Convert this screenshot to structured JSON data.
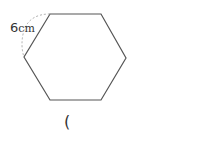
{
  "figure": {
    "shape": "regular-hexagon",
    "side_length_label": {
      "value": "6",
      "unit": "cm"
    },
    "stroke_color": "#555555",
    "dashed_arc_color": "#999999"
  },
  "answer_blank": {
    "open_paren": "("
  }
}
